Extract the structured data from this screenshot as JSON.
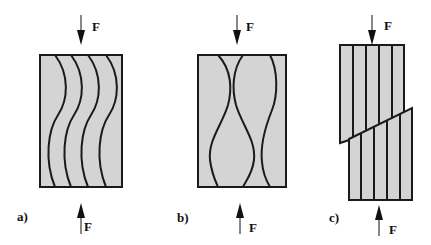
{
  "figure": {
    "colors": {
      "fill": "#d4d4d4",
      "stroke": "#1a1a1a",
      "arrow": "#111111"
    },
    "panels": [
      {
        "id": "a",
        "label": "a)",
        "force_top": "F",
        "force_bottom": "F",
        "description": "wavy fibers in phase (shear-mode buckling)"
      },
      {
        "id": "b",
        "label": "b)",
        "force_top": "F",
        "force_bottom": "F",
        "description": "wavy fibers out of phase (extension-mode buckling)"
      },
      {
        "id": "c",
        "label": "c)",
        "force_top": "F",
        "force_bottom": "F",
        "description": "straight fibers with oblique shear fracture"
      }
    ]
  }
}
